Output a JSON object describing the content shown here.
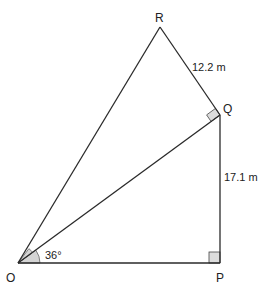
{
  "diagram": {
    "vertices": {
      "O": {
        "label": "O",
        "x": 18,
        "y": 263
      },
      "P": {
        "label": "P",
        "x": 220,
        "y": 263
      },
      "Q": {
        "label": "Q",
        "x": 220,
        "y": 115
      },
      "R": {
        "label": "R",
        "x": 160,
        "y": 27
      }
    },
    "edges": [
      {
        "from": "O",
        "to": "P"
      },
      {
        "from": "P",
        "to": "Q"
      },
      {
        "from": "Q",
        "to": "R"
      },
      {
        "from": "R",
        "to": "O"
      },
      {
        "from": "O",
        "to": "Q"
      }
    ],
    "measurements": {
      "QR": "12.2 m",
      "PQ": "17.1 m"
    },
    "angles": {
      "QOP": "36°",
      "ROQ": ""
    },
    "right_angles": [
      "P",
      "Q"
    ],
    "colors": {
      "line": "#2a2a2a",
      "shade": "#d4d4d4",
      "background": "#ffffff"
    }
  }
}
